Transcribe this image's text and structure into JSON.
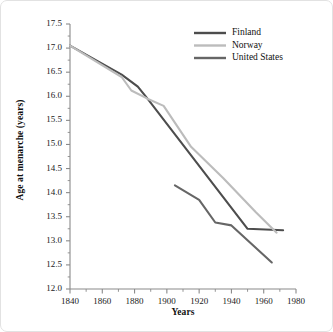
{
  "chart_data": {
    "type": "line",
    "title": "",
    "xlabel": "Years",
    "ylabel": "Age at menarche (years)",
    "xlim": [
      1840,
      1980
    ],
    "ylim": [
      12.0,
      17.5
    ],
    "xticks": [
      "1840",
      "1860",
      "1880",
      "1900",
      "1920",
      "1940",
      "1960",
      "1980"
    ],
    "xtick_values": [
      1840,
      1860,
      1880,
      1900,
      1920,
      1940,
      1960,
      1980
    ],
    "yticks": [
      "12.0",
      "12.5",
      "13.0",
      "13.5",
      "14.0",
      "14.5",
      "15.0",
      "15.5",
      "16.0",
      "16.5",
      "17.0",
      "17.5"
    ],
    "ytick_values": [
      12.0,
      12.5,
      13.0,
      13.5,
      14.0,
      14.5,
      15.0,
      15.5,
      16.0,
      16.5,
      17.0,
      17.5
    ],
    "grid": false,
    "minor_ticks": true,
    "legend_position": "top-right",
    "series": [
      {
        "name": "Finland",
        "color": "#4d4d4d",
        "x": [
          1840,
          1872,
          1882,
          1888,
          1950,
          1972
        ],
        "y": [
          17.05,
          16.45,
          16.2,
          15.95,
          13.25,
          13.22
        ],
        "values": [
          17.05,
          16.45,
          16.2,
          15.95,
          13.25,
          13.22
        ]
      },
      {
        "name": "Norway",
        "color": "#bcbcbc",
        "x": [
          1840,
          1872,
          1878,
          1888,
          1898,
          1915,
          1935,
          1955,
          1968
        ],
        "y": [
          17.05,
          16.4,
          16.12,
          15.95,
          15.8,
          14.95,
          14.3,
          13.6,
          13.17
        ],
        "values": [
          17.05,
          16.4,
          16.12,
          15.95,
          15.8,
          14.95,
          14.3,
          13.6,
          13.17
        ]
      },
      {
        "name": "United States",
        "color": "#666666",
        "x": [
          1905,
          1920,
          1930,
          1940,
          1965
        ],
        "y": [
          14.15,
          13.85,
          13.38,
          13.32,
          12.55
        ],
        "values": [
          14.15,
          13.85,
          13.38,
          13.32,
          12.55
        ]
      }
    ]
  },
  "legend": {
    "entries": [
      {
        "label": "Finland"
      },
      {
        "label": "Norway"
      },
      {
        "label": "United States"
      }
    ]
  },
  "colors": {
    "finland": "#4d4d4d",
    "norway": "#bcbcbc",
    "united_states": "#666666",
    "axis": "#8a8a8a",
    "text": "#111111",
    "frame": "#e2e2e2"
  }
}
